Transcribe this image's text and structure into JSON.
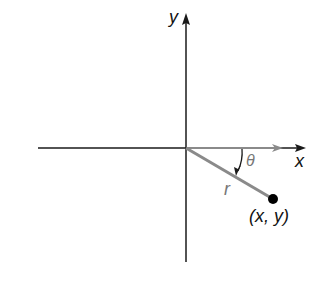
{
  "diagram": {
    "type": "polar-coordinate-figure",
    "axes": {
      "x_label": "x",
      "y_label": "y"
    },
    "labels": {
      "radius": "r",
      "angle": "θ",
      "point": "(x, y)"
    },
    "colors": {
      "axis": "#1a1a1a",
      "terminal_side": "#8a8a8a",
      "initial_side_arrow": "#8a8a8a",
      "angle_arc": "#1a1a1a",
      "point": "#000000"
    }
  }
}
